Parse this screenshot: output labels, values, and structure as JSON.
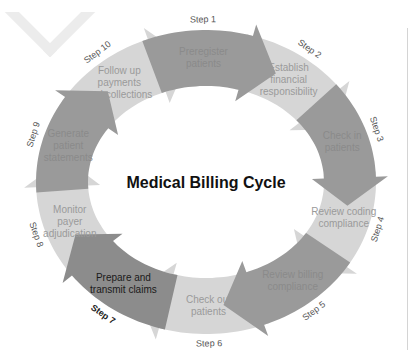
{
  "title": "Medical Billing Cycle",
  "colors": {
    "dark_arrow": "#9a9a9a",
    "light_arrow": "#d6d6d6",
    "dark_text": "#8a8a8a",
    "light_text": "#9a9a9a",
    "highlight_arrow": "#8c8c8c",
    "highlight_text": "#1a1a1a",
    "step_label": "#555555",
    "title": "#111111",
    "rule": "#d4d4d4"
  },
  "steps": [
    {
      "step": "Step 1",
      "lines": [
        "Preregister",
        "patients"
      ],
      "tone": "dark"
    },
    {
      "step": "Step 2",
      "lines": [
        "Establish",
        "financial",
        "responsibility"
      ],
      "tone": "light"
    },
    {
      "step": "Step 3",
      "lines": [
        "Check in",
        "patients"
      ],
      "tone": "dark"
    },
    {
      "step": "Step 4",
      "lines": [
        "Review coding",
        "compliance"
      ],
      "tone": "light"
    },
    {
      "step": "Step 5",
      "lines": [
        "Review billing",
        "compliance"
      ],
      "tone": "dark"
    },
    {
      "step": "Step 6",
      "lines": [
        "Check out",
        "patients"
      ],
      "tone": "light"
    },
    {
      "step": "Step 7",
      "lines": [
        "Prepare and",
        "transmit claims"
      ],
      "tone": "highlight"
    },
    {
      "step": "Step 8",
      "lines": [
        "Monitor",
        "payer",
        "adjudication"
      ],
      "tone": "light"
    },
    {
      "step": "Step 9",
      "lines": [
        "Generate",
        "patient",
        "statements"
      ],
      "tone": "dark"
    },
    {
      "step": "Step 10",
      "lines": [
        "Follow up",
        "payments",
        "and collections"
      ],
      "tone": "light"
    }
  ]
}
